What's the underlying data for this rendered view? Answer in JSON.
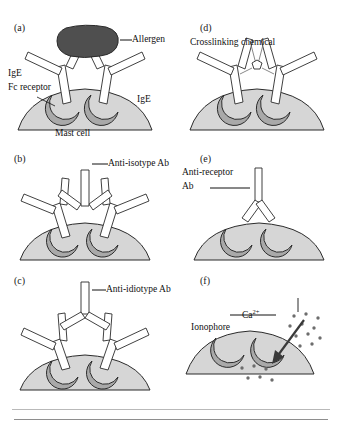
{
  "figure": {
    "background_color": "#ffffff",
    "colors": {
      "mast_cell_body": "#d6d6d6",
      "fc_receptor": "#a9a9a9",
      "allergen": "#4f4f4f",
      "antibody_fill": "#ffffff",
      "outline": "#2b2b2b",
      "text": "#111111",
      "rule": "#b9b9b9"
    },
    "bottom_rules": [
      {
        "name": "upper-rule",
        "y": 409
      },
      {
        "name": "lower-rule",
        "y": 419
      }
    ]
  },
  "panels": [
    {
      "id": "a",
      "letter": "(a)",
      "mechanism": "Allergen crosslinking of IgE bound to Fc receptors",
      "labels": [
        {
          "name": "allergen-label",
          "text": "Allergen"
        },
        {
          "name": "ige-left-label",
          "text": "IgE"
        },
        {
          "name": "fc-receptor-label",
          "text": "Fc receptor"
        },
        {
          "name": "ige-right-label",
          "text": "IgE"
        },
        {
          "name": "mast-cell-label",
          "text": "Mast cell"
        }
      ]
    },
    {
      "id": "b",
      "letter": "(b)",
      "mechanism": "Anti-isotype antibody crosslinking bound IgE",
      "labels": [
        {
          "name": "anti-isotype-label",
          "text": "Anti-isotype Ab"
        }
      ]
    },
    {
      "id": "c",
      "letter": "(c)",
      "mechanism": "Anti-idiotype antibody crosslinking bound IgE",
      "labels": [
        {
          "name": "anti-idiotype-label",
          "text": "Anti-idiotype Ab"
        }
      ]
    },
    {
      "id": "d",
      "letter": "(d)",
      "mechanism": "Chemical crosslinking of IgE",
      "labels": [
        {
          "name": "crosslinking-chemical-label",
          "text": "Crosslinking chemical"
        }
      ]
    },
    {
      "id": "e",
      "letter": "(e)",
      "mechanism": "Anti-receptor antibody crosslinking Fc receptors",
      "labels": [
        {
          "name": "anti-receptor-label-line1",
          "text": "Anti-receptor"
        },
        {
          "name": "anti-receptor-label-line2",
          "text": "Ab"
        }
      ]
    },
    {
      "id": "f",
      "letter": "(f)",
      "mechanism": "Ionophore-mediated calcium influx",
      "labels": [
        {
          "name": "ionophore-label",
          "text": "Ionophore"
        },
        {
          "name": "calcium-label",
          "text": "Ca"
        },
        {
          "name": "calcium-charge",
          "text": "2+"
        }
      ]
    }
  ]
}
